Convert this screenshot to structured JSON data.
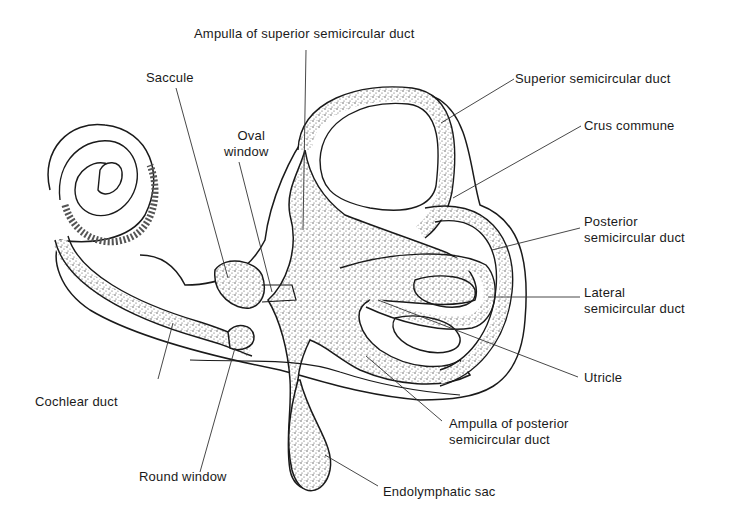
{
  "figure": {
    "labels": {
      "ampulla_superior": "Ampulla of superior semicircular duct",
      "saccule": "Saccule",
      "superior_duct": "Superior semicircular duct",
      "crus_commune": "Crus commune",
      "oval_window_1": "Oval",
      "oval_window_2": "window",
      "posterior_duct_1": "Posterior",
      "posterior_duct_2": "semicircular duct",
      "lateral_duct_1": "Lateral",
      "lateral_duct_2": "semicircular duct",
      "utricle": "Utricle",
      "cochlear_duct": "Cochlear duct",
      "ampulla_posterior_1": "Ampulla of posterior",
      "ampulla_posterior_2": "semicircular duct",
      "round_window": "Round window",
      "endolymphatic_sac": "Endolymphatic sac"
    },
    "colors": {
      "line": "#1a1a1a",
      "stipple": "#555555",
      "background": "#ffffff"
    }
  }
}
